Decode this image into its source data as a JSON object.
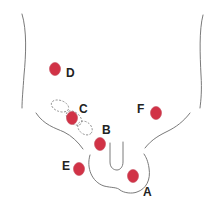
{
  "diagram": {
    "type": "anatomical-site-map",
    "marker_color": "#d13246",
    "outline_color": "#7a7a7a",
    "points": [
      {
        "id": "A",
        "label": "A"
      },
      {
        "id": "B",
        "label": "B"
      },
      {
        "id": "C",
        "label": "C"
      },
      {
        "id": "D",
        "label": "D"
      },
      {
        "id": "E",
        "label": "E"
      },
      {
        "id": "F",
        "label": "F"
      }
    ]
  }
}
